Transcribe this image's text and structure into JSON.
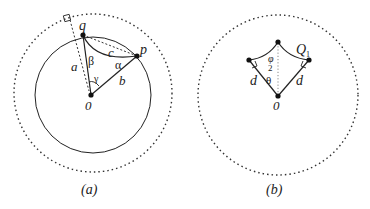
{
  "panels": [
    {
      "id": "a",
      "caption": "(a)",
      "labels": {
        "q": "q",
        "p": "p",
        "origin": "0",
        "a": "a",
        "b": "b",
        "c": "c",
        "alpha": "α",
        "beta": "β",
        "gamma": "γ"
      }
    },
    {
      "id": "b",
      "caption": "(b)",
      "labels": {
        "q1": "Q",
        "q1_sub": "1",
        "d_left": "d",
        "d_right": "d",
        "origin": "0",
        "phi_num": "φ",
        "phi_den": "2",
        "theta": "θ"
      }
    }
  ],
  "colors": {
    "stroke": "#222222",
    "dotted": "#333333",
    "inner_dotted": "#888888"
  }
}
